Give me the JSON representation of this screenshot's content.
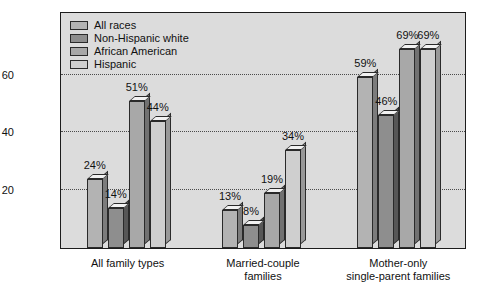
{
  "chart_data": {
    "type": "bar",
    "title": "",
    "subtitle": "",
    "xlabel": "",
    "ylabel": "",
    "ylim": [
      0,
      82
    ],
    "yticks": [
      20,
      40,
      60
    ],
    "ytick_labels": [
      "20",
      "40",
      "60"
    ],
    "grid": true,
    "legend_position": "top-left",
    "value_label_suffix": "%",
    "categories": [
      "All family types",
      "Married-couple\nfamilies",
      "Mother-only\nsingle-parent families"
    ],
    "series": [
      {
        "name": "All races",
        "values": [
          24,
          13,
          59
        ],
        "labels": [
          "24%",
          "13%",
          "59%"
        ],
        "color": "#b3b3b3"
      },
      {
        "name": "Non-Hispanic white",
        "values": [
          14,
          8,
          46
        ],
        "labels": [
          "14%",
          "8%",
          "46%"
        ],
        "color": "#8e8e8e"
      },
      {
        "name": "African American",
        "values": [
          51,
          19,
          69
        ],
        "labels": [
          "51%",
          "19%",
          "69%"
        ],
        "color": "#a8a8a8"
      },
      {
        "name": "Hispanic",
        "values": [
          44,
          34,
          69
        ],
        "labels": [
          "44%",
          "34%",
          "69%"
        ],
        "color": "#cfcfcf"
      }
    ]
  },
  "legend": {
    "items": [
      {
        "label": "All races"
      },
      {
        "label": "Non-Hispanic white"
      },
      {
        "label": "African American"
      },
      {
        "label": "Hispanic"
      }
    ]
  },
  "colors": {
    "plot_background": "#dcdcdc",
    "page_background": "#ffffff",
    "axis": "#1c1c1c",
    "gridline": "#4a4a4a",
    "bar_top": "#f2f2f2",
    "bar_side_darken": "#6f6f6f"
  }
}
